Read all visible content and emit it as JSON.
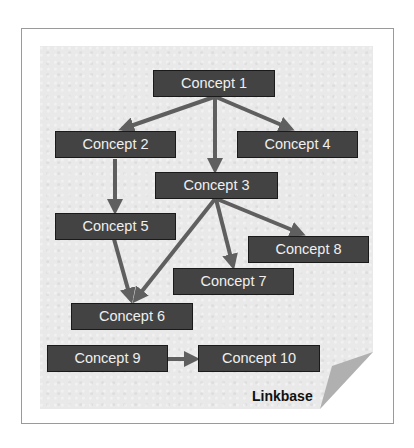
{
  "diagram": {
    "caption": "Linkbase",
    "colors": {
      "background": "#e9e9e9",
      "node_fill": "#434343",
      "node_border": "#1a1a1a",
      "node_text": "#efefef",
      "edge": "#5f5f5f",
      "curl": "#b0b0b0"
    },
    "nodes": [
      {
        "id": "c1",
        "label": "Concept 1"
      },
      {
        "id": "c2",
        "label": "Concept 2"
      },
      {
        "id": "c3",
        "label": "Concept 3"
      },
      {
        "id": "c4",
        "label": "Concept 4"
      },
      {
        "id": "c5",
        "label": "Concept 5"
      },
      {
        "id": "c6",
        "label": "Concept 6"
      },
      {
        "id": "c7",
        "label": "Concept 7"
      },
      {
        "id": "c8",
        "label": "Concept 8"
      },
      {
        "id": "c9",
        "label": "Concept 9"
      },
      {
        "id": "c10",
        "label": "Concept 10"
      }
    ],
    "edges": [
      {
        "from": "Concept 1",
        "to": "Concept 2"
      },
      {
        "from": "Concept 1",
        "to": "Concept 3"
      },
      {
        "from": "Concept 1",
        "to": "Concept 4"
      },
      {
        "from": "Concept 2",
        "to": "Concept 5"
      },
      {
        "from": "Concept 3",
        "to": "Concept 6"
      },
      {
        "from": "Concept 3",
        "to": "Concept 7"
      },
      {
        "from": "Concept 3",
        "to": "Concept 8"
      },
      {
        "from": "Concept 5",
        "to": "Concept 6"
      },
      {
        "from": "Concept 9",
        "to": "Concept 10"
      }
    ]
  }
}
